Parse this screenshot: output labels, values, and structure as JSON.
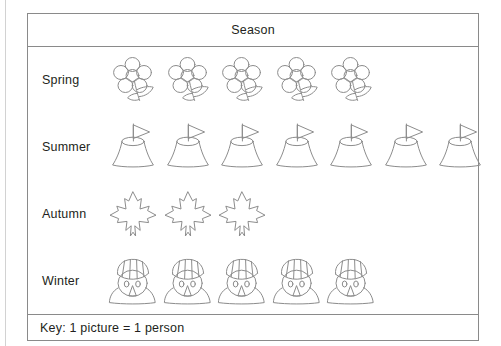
{
  "chart_data": {
    "type": "bar",
    "title": "Season",
    "subtitle": "",
    "xlabel": "",
    "ylabel": "Season",
    "categories": [
      "Spring",
      "Summer",
      "Autumn",
      "Winter"
    ],
    "values": [
      5,
      7,
      3,
      5
    ],
    "unit": "person",
    "key": "Key: 1 picture = 1 person",
    "symbol_value": 1,
    "legend": "",
    "grid": false,
    "rows": [
      {
        "label": "Spring",
        "count": 5,
        "icon": "flower-icon"
      },
      {
        "label": "Summer",
        "count": 7,
        "icon": "sandcastle-icon"
      },
      {
        "label": "Autumn",
        "count": 3,
        "icon": "maple-leaf-icon"
      },
      {
        "label": "Winter",
        "count": 5,
        "icon": "snowman-icon"
      }
    ]
  },
  "table": {
    "header": {
      "title": "Season"
    },
    "footer": {
      "key_text": "Key: 1 picture = 1 person"
    }
  },
  "colors": {
    "border": "#8a8a8a",
    "icon_stroke": "#8c8c8c",
    "text": "#231f20",
    "page_rule": "#d2d2d2",
    "background": "#ffffff"
  }
}
